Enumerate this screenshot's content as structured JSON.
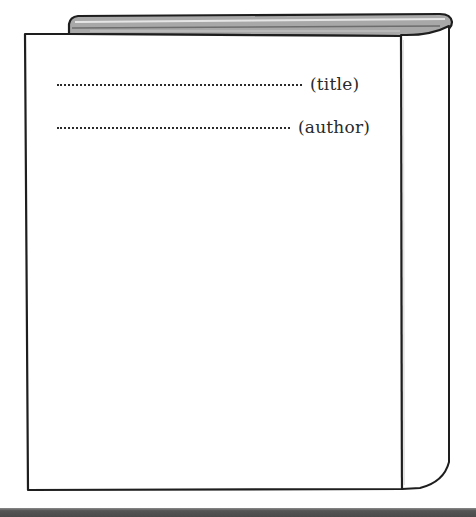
{
  "book": {
    "title_field": {
      "placeholder_dots": "……………………………………",
      "label": "(title)"
    },
    "author_field": {
      "placeholder_dots": "……………………………………",
      "label": "(author)"
    }
  },
  "colors": {
    "outline": "#1e1e1e",
    "page_edges": "#9a9a9a",
    "background": "#ffffff",
    "bottom_bar": "#4d4d4d"
  }
}
